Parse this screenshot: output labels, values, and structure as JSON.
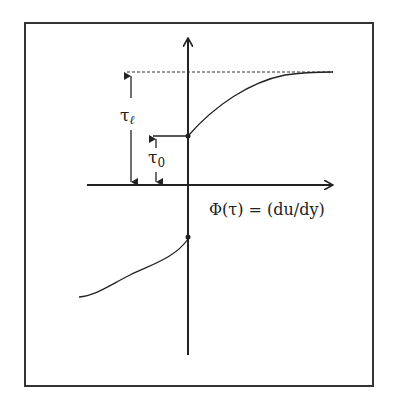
{
  "figure": {
    "type": "diagram",
    "x_axis_label": "Φ(τ) = (du/dy)",
    "labels": {
      "tau_l": "τ",
      "tau_l_sub": "ℓ",
      "tau_0": "τ",
      "tau_0_sub": "0"
    },
    "annotations": [
      {
        "name": "tau_l",
        "meaning": "limiting stress level (dashed asymptote)"
      },
      {
        "name": "tau_0",
        "meaning": "yield stress (jump at origin)"
      }
    ],
    "colors": {
      "stroke": "#222222",
      "background": "#ffffff"
    }
  }
}
